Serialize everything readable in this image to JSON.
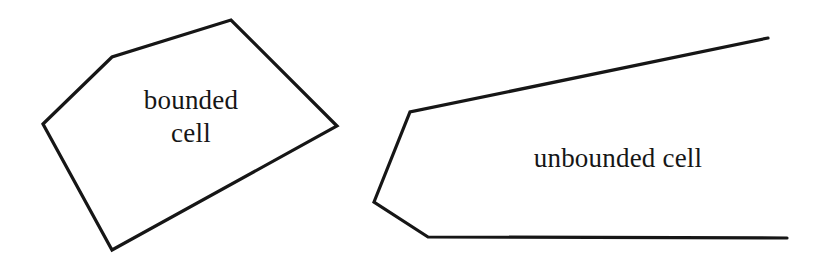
{
  "figure": {
    "background_color": "#ffffff",
    "stroke_color": "#161616",
    "stroke_width": 3.2
  },
  "labels": {
    "bounded": "bounded\ncell",
    "bounded_line_1": "bounded",
    "bounded_line_2": "cell",
    "unbounded": "unbounded cell"
  },
  "chart_data": {
    "type": "diagram",
    "shapes": [
      {
        "name": "bounded-cell-polygon",
        "closed": true,
        "label": "bounded cell",
        "points": [
          [
            43,
            124
          ],
          [
            112,
            57
          ],
          [
            231,
            20
          ],
          [
            337,
            126
          ],
          [
            112,
            250
          ]
        ]
      },
      {
        "name": "unbounded-cell-region",
        "closed": false,
        "label": "unbounded cell",
        "points": [
          [
            768,
            38
          ],
          [
            410,
            112
          ],
          [
            374,
            202
          ],
          [
            428,
            237
          ],
          [
            787,
            238
          ]
        ]
      }
    ]
  }
}
